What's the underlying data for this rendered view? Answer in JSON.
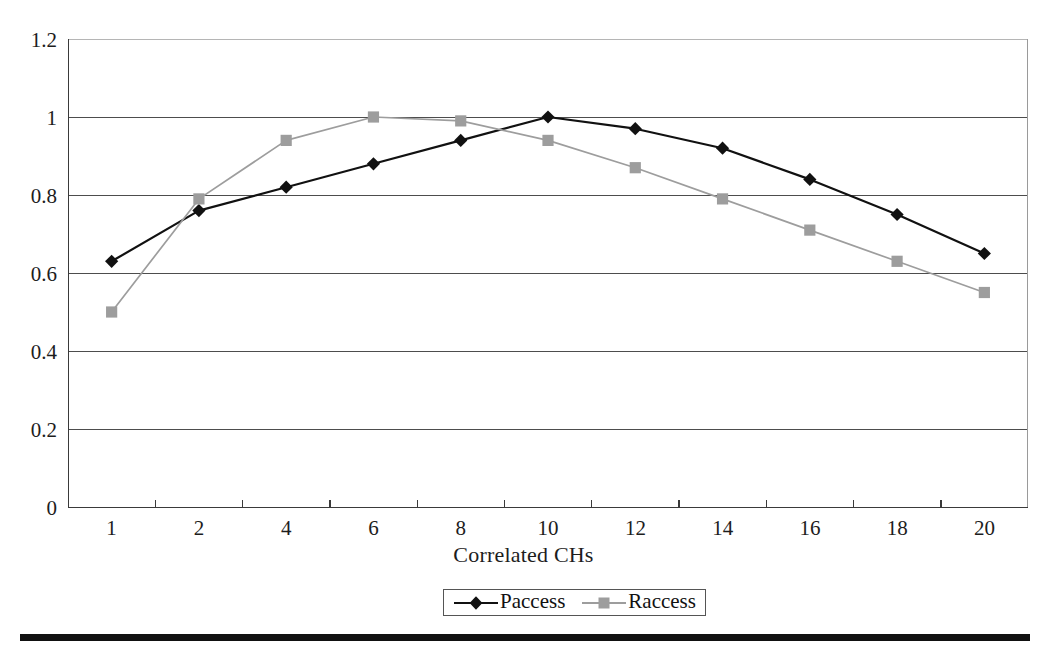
{
  "chart_data": {
    "type": "line",
    "title": "",
    "subtitle": "",
    "xlabel": "Correlated CHs",
    "ylabel": "",
    "categories": [
      "1",
      "2",
      "4",
      "6",
      "8",
      "10",
      "12",
      "14",
      "16",
      "18",
      "20"
    ],
    "series": [
      {
        "name": "Paccess",
        "marker": "diamond",
        "color": "#111111",
        "values": [
          0.63,
          0.76,
          0.82,
          0.88,
          0.94,
          1.0,
          0.97,
          0.92,
          0.84,
          0.75,
          0.65
        ]
      },
      {
        "name": "Raccess",
        "marker": "square",
        "color": "#9d9d9d",
        "values": [
          0.5,
          0.79,
          0.94,
          1.0,
          0.99,
          0.94,
          0.87,
          0.79,
          0.71,
          0.63,
          0.55
        ]
      }
    ],
    "ylim": [
      0,
      1.2
    ],
    "y_ticks": [
      0,
      0.2,
      0.4,
      0.6,
      0.8,
      1.0,
      1.2
    ],
    "y_tick_labels": [
      "0",
      "0.2",
      "0.4",
      "0.6",
      "0.8",
      "1",
      "1.2"
    ],
    "x_tick_labels": [
      "1",
      "2",
      "4",
      "6",
      "8",
      "10",
      "12",
      "14",
      "16",
      "18",
      "20"
    ],
    "grid": true,
    "grid_axis": "y",
    "legend": {
      "position": "bottom-center",
      "entries": [
        "Paccess",
        "Raccess"
      ]
    }
  }
}
